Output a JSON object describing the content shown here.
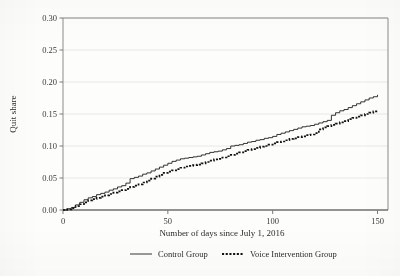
{
  "chart_data": {
    "type": "line",
    "title": "",
    "subtitle": "",
    "xlabel": "Number of days since July 1, 2016",
    "ylabel": "Quit share",
    "xlim": [
      0,
      155
    ],
    "ylim": [
      0.0,
      0.3
    ],
    "grid": "horizontal",
    "legend_position": "bottom",
    "xticks": [
      0,
      50,
      100,
      150
    ],
    "xticklabels": [
      "0",
      "50",
      "100",
      "150"
    ],
    "yticks": [
      0.0,
      0.05,
      0.1,
      0.15,
      0.2,
      0.25,
      0.3
    ],
    "yticklabels": [
      "0.00",
      "0.05",
      "0.10",
      "0.15",
      "0.20",
      "0.25",
      "0.30"
    ],
    "series": [
      {
        "name": "Control Group",
        "style": "solid",
        "color": "#1e1e1e",
        "x": [
          0,
          2,
          4,
          6,
          8,
          10,
          12,
          14,
          16,
          18,
          20,
          22,
          24,
          26,
          28,
          30,
          32,
          34,
          36,
          38,
          40,
          42,
          44,
          46,
          48,
          50,
          52,
          54,
          56,
          58,
          60,
          62,
          64,
          66,
          68,
          70,
          72,
          74,
          76,
          78,
          80,
          82,
          84,
          86,
          88,
          90,
          92,
          94,
          96,
          98,
          100,
          102,
          104,
          106,
          108,
          110,
          112,
          114,
          116,
          118,
          120,
          122,
          124,
          126,
          128,
          130,
          132,
          134,
          136,
          138,
          140,
          142,
          144,
          146,
          148,
          150
        ],
        "y": [
          0.0,
          0.002,
          0.004,
          0.008,
          0.012,
          0.016,
          0.019,
          0.021,
          0.024,
          0.026,
          0.028,
          0.031,
          0.033,
          0.036,
          0.038,
          0.042,
          0.049,
          0.051,
          0.053,
          0.056,
          0.058,
          0.061,
          0.064,
          0.067,
          0.07,
          0.073,
          0.076,
          0.078,
          0.08,
          0.081,
          0.082,
          0.083,
          0.084,
          0.086,
          0.088,
          0.09,
          0.091,
          0.092,
          0.094,
          0.096,
          0.1,
          0.101,
          0.102,
          0.104,
          0.106,
          0.107,
          0.109,
          0.11,
          0.112,
          0.113,
          0.115,
          0.118,
          0.12,
          0.122,
          0.124,
          0.126,
          0.128,
          0.13,
          0.131,
          0.132,
          0.134,
          0.136,
          0.138,
          0.14,
          0.148,
          0.152,
          0.155,
          0.157,
          0.16,
          0.163,
          0.166,
          0.169,
          0.172,
          0.175,
          0.177,
          0.18
        ]
      },
      {
        "name": "Voice Intervention Group",
        "style": "dotted",
        "color": "#121212",
        "x": [
          0,
          2,
          4,
          6,
          8,
          10,
          12,
          14,
          16,
          18,
          20,
          22,
          24,
          26,
          28,
          30,
          32,
          34,
          36,
          38,
          40,
          42,
          44,
          46,
          48,
          50,
          52,
          54,
          56,
          58,
          60,
          62,
          64,
          66,
          68,
          70,
          72,
          74,
          76,
          78,
          80,
          82,
          84,
          86,
          88,
          90,
          92,
          94,
          96,
          98,
          100,
          102,
          104,
          106,
          108,
          110,
          112,
          114,
          116,
          118,
          120,
          122,
          124,
          126,
          128,
          130,
          132,
          134,
          136,
          138,
          140,
          142,
          144,
          146,
          148,
          150
        ],
        "y": [
          0.0,
          0.001,
          0.003,
          0.006,
          0.009,
          0.012,
          0.015,
          0.017,
          0.019,
          0.021,
          0.023,
          0.025,
          0.027,
          0.029,
          0.031,
          0.033,
          0.036,
          0.038,
          0.04,
          0.043,
          0.046,
          0.049,
          0.052,
          0.055,
          0.058,
          0.06,
          0.062,
          0.064,
          0.066,
          0.068,
          0.069,
          0.07,
          0.071,
          0.073,
          0.075,
          0.077,
          0.079,
          0.08,
          0.082,
          0.084,
          0.086,
          0.088,
          0.09,
          0.092,
          0.094,
          0.095,
          0.097,
          0.099,
          0.1,
          0.102,
          0.104,
          0.106,
          0.107,
          0.109,
          0.111,
          0.112,
          0.114,
          0.115,
          0.117,
          0.118,
          0.12,
          0.126,
          0.129,
          0.131,
          0.133,
          0.135,
          0.137,
          0.139,
          0.142,
          0.144,
          0.146,
          0.148,
          0.15,
          0.152,
          0.154,
          0.156
        ]
      }
    ],
    "legend": [
      {
        "label": "Control Group",
        "style": "solid"
      },
      {
        "label": "Voice Intervention Group",
        "style": "dotted"
      }
    ]
  }
}
